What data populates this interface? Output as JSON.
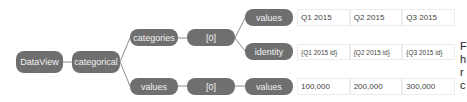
{
  "diagram": {
    "nodes": {
      "dataview": "DataView",
      "categorical": "categorical",
      "categories": "categories",
      "categories_index": "[0]",
      "categories_values": "values",
      "categories_identity": "identity",
      "values": "values",
      "values_index": "[0]",
      "values_values": "values"
    },
    "rows": {
      "category_values": [
        "Q1 2015",
        "Q2 2015",
        "Q3 2015"
      ],
      "category_identity": [
        "{Q1 2015 id}",
        "{Q2 2015 id}",
        "{Q3 2015 id}"
      ],
      "value_values": [
        "100,000",
        "200,000",
        "300,000"
      ]
    },
    "colors": {
      "node_fill": "#6f6f6f",
      "node_text": "#f2f2f2",
      "connector": "#8a8a8a",
      "cell_border": "#ececec"
    }
  },
  "cutoff_text": {
    "line1": "F",
    "line2": "h",
    "line3": "r",
    "line4": "c"
  }
}
